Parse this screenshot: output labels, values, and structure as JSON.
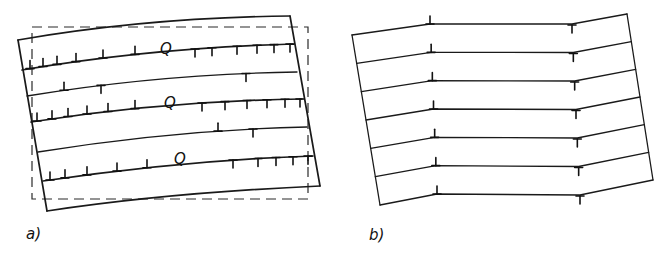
{
  "figure": {
    "panels": [
      {
        "id": "a",
        "label": "a)",
        "description": "Crystal with curved slip planes; edge dislocations of opposite sign piled up on each side of bent lattice planes, frame rotated against dashed reference outline",
        "q_labels": [
          "Q",
          "Q",
          "Q"
        ],
        "layers": [
          {
            "left_dislocations": 6,
            "right_dislocations": 6,
            "label": "Q"
          },
          {
            "left_dislocations": 1,
            "right_dislocations": 1,
            "left_inverted": 1
          },
          {
            "left_dislocations": 7,
            "right_dislocations": 6,
            "label": "Q"
          },
          {
            "left_dislocations": 1,
            "right_dislocations": 1
          },
          {
            "left_dislocations": 5,
            "right_dislocations": 5,
            "label": "Q"
          }
        ]
      },
      {
        "id": "b",
        "label": "b)",
        "description": "Kinked lattice planes forming tilt boundaries; one positive edge dislocation (⊥) and one negative edge dislocation (T) per plane",
        "plane_count": 7,
        "dislocations_per_plane": {
          "positive": 1,
          "negative": 1
        }
      }
    ],
    "symbols": {
      "positive_edge": "⊥",
      "negative_edge": "T"
    }
  }
}
